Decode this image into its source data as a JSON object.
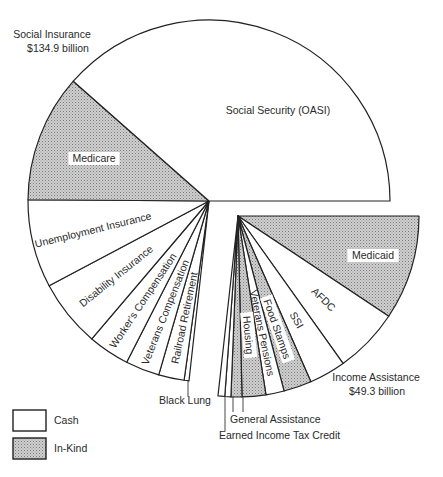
{
  "chart_data": {
    "type": "pie",
    "title": "",
    "units": "billion dollars",
    "legend": {
      "position": "bottom-left",
      "entries": [
        {
          "label": "Cash",
          "fill": "cash"
        },
        {
          "label": "In-Kind",
          "fill": "in-kind"
        }
      ]
    },
    "colors": {
      "cash": "#ffffff",
      "in_kind_base": "#c9c9c9",
      "in_kind_dot": "#8c8c8c",
      "stroke": "#222222"
    },
    "groups": [
      {
        "name": "Social Insurance",
        "label": "Social Insurance",
        "total_label": "$134.9 billion",
        "total": 134.9,
        "exploded": false,
        "slices": [
          {
            "label": "Black Lung",
            "value": 0.8,
            "type": "cash",
            "label_mode": "leader"
          },
          {
            "label": "Railroad Retirement",
            "value": 4.2,
            "type": "cash",
            "label_mode": "radial"
          },
          {
            "label": "Veterans Compensation",
            "value": 5.6,
            "type": "cash",
            "label_mode": "radial"
          },
          {
            "label": "Worker's Compensation",
            "value": 6.8,
            "type": "cash",
            "label_mode": "radial"
          },
          {
            "label": "Disability Insurance",
            "value": 11.1,
            "type": "cash",
            "label_mode": "radial"
          },
          {
            "label": "Unemployment Insurance",
            "value": 14.5,
            "type": "cash",
            "label_mode": "radial"
          },
          {
            "label": "Medicare",
            "value": 21.0,
            "type": "in-kind",
            "label_mode": "horizontal"
          },
          {
            "label": "Social Security (OASI)",
            "value": 70.9,
            "type": "cash",
            "label_mode": "horizontal"
          }
        ]
      },
      {
        "name": "Income Assistance",
        "label": "Income Assistance",
        "total_label": "$49.3 billion",
        "total": 49.3,
        "exploded": true,
        "slices": [
          {
            "label": "Medicaid",
            "value": 17.2,
            "type": "in-kind",
            "label_mode": "horizontal"
          },
          {
            "label": "AFDC",
            "value": 10.7,
            "type": "cash",
            "label_mode": "radial"
          },
          {
            "label": "SSI",
            "value": 6.0,
            "type": "cash",
            "label_mode": "radial"
          },
          {
            "label": "Food Stamps",
            "value": 4.6,
            "type": "in-kind",
            "label_mode": "radial"
          },
          {
            "label": "Veterans Pensions",
            "value": 3.0,
            "type": "cash",
            "label_mode": "radial"
          },
          {
            "label": "Housing",
            "value": 3.9,
            "type": "in-kind",
            "label_mode": "radial"
          },
          {
            "label": "General Assistance",
            "value": 1.8,
            "type": "in-kind",
            "label_mode": "leader"
          },
          {
            "label": "General Assistance",
            "value": 1.0,
            "type": "cash",
            "label_mode": "leader"
          },
          {
            "label": "Earned Income Tax Credit",
            "value": 1.1,
            "type": "cash",
            "label_mode": "leader"
          }
        ]
      }
    ]
  },
  "labels": {
    "social_insurance_title": "Social Insurance",
    "social_insurance_total": "$134.9 billion",
    "income_assistance_title": "Income Assistance",
    "income_assistance_total": "$49.3 billion",
    "black_lung": "Black Lung",
    "general_assistance": "General Assistance",
    "eitc": "Earned Income Tax Credit",
    "legend_cash": "Cash",
    "legend_in_kind": "In-Kind"
  }
}
